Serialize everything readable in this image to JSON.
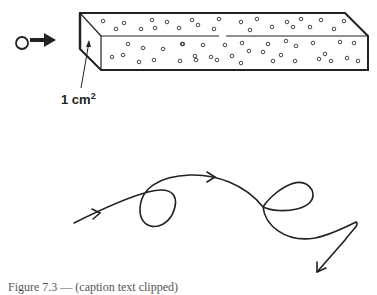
{
  "figure": {
    "top_diagram": {
      "description": "Particle approaching a rectangular slab of 1 cm² cross-section filled with scattered small circles (target atoms)",
      "incident_particle_icon": "open-circle",
      "direction_icon": "bold-right-arrow",
      "area_label": "1 cm",
      "area_label_superscript": "2"
    },
    "bottom_diagram": {
      "description": "Meandering particle trajectory with two loops and direction arrows"
    },
    "caption": "Figure 7.3 — (caption text clipped)"
  }
}
